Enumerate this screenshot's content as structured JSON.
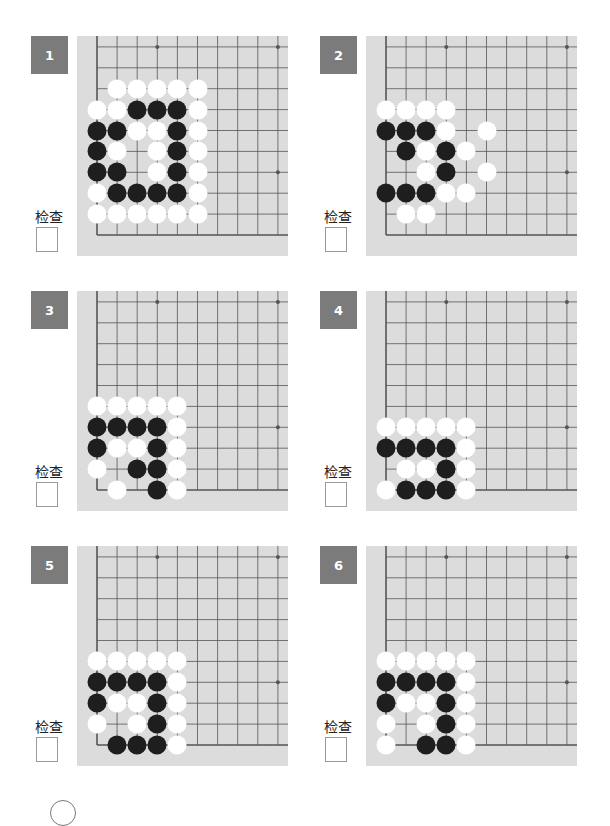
{
  "worksheet": {
    "check_label": "检查",
    "colors": {
      "badge": "#7b7b7b",
      "board": "#dcdcdc",
      "grid_line": "#555555",
      "black_stone": "#1e1e1e",
      "white_stone": "#ffffff"
    },
    "problems": [
      {
        "number": "1",
        "rows": [
          ".WWWWW",
          "WWBBBW",
          "BBWWBW",
          "BW.WBW",
          "BB.WBW",
          "WBBBBW",
          "WWWWWW",
          "......"
        ]
      },
      {
        "number": "2",
        "rows": [
          "WWWW..",
          "BBBW.W",
          ".BWBW.",
          "..WB.W",
          "BBBWW.",
          ".WW...",
          "......"
        ]
      },
      {
        "number": "3",
        "rows": [
          "WWWWW",
          "BBBBW",
          "BWWBW",
          "W.BBW",
          ".W.BW"
        ]
      },
      {
        "number": "4",
        "rows": [
          "WWWWW",
          "BBBBW",
          ".WWBW",
          "WBBBW"
        ]
      },
      {
        "number": "5",
        "rows": [
          "WWWWW",
          "BBBBW",
          "BWWBW",
          "W.WBW",
          ".BBBW"
        ]
      },
      {
        "number": "6",
        "rows": [
          "WWWWW",
          "BBBBW",
          "BWWBW",
          "W.WBW",
          "W.BBW"
        ]
      }
    ]
  }
}
